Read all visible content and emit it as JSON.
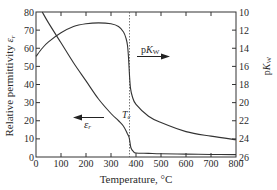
{
  "chart_data": {
    "type": "line",
    "title": "",
    "xlabel": "Temperature, °C",
    "ylabel": "Relative permittivity εr",
    "y2label": "pKw",
    "xlim": [
      0,
      800
    ],
    "ylim": [
      0,
      80
    ],
    "y2lim": [
      10,
      26
    ],
    "y2_inverted": true,
    "x_ticks": [
      0,
      100,
      200,
      300,
      400,
      500,
      600,
      700,
      800
    ],
    "y_ticks": [
      0,
      10,
      20,
      30,
      40,
      50,
      60,
      70,
      80
    ],
    "y2_ticks": [
      10,
      12,
      14,
      16,
      18,
      20,
      22,
      24,
      26
    ],
    "grid": false,
    "series": [
      {
        "name": "εr",
        "axis": "left",
        "x": [
          25,
          50,
          100,
          150,
          200,
          250,
          300,
          330,
          350,
          365,
          372,
          376,
          380,
          390,
          400,
          450,
          500,
          600,
          700,
          800
        ],
        "values": [
          80,
          74,
          63,
          52,
          42,
          32,
          24,
          20,
          17,
          13,
          11,
          8,
          5,
          3,
          2.2,
          2,
          1.8,
          1.6,
          1.4,
          1.3
        ]
      },
      {
        "name": "pKw",
        "axis": "right",
        "x": [
          0,
          25,
          50,
          100,
          150,
          200,
          250,
          300,
          330,
          350,
          360,
          366,
          370,
          374,
          378,
          385,
          400,
          450,
          500,
          600,
          700,
          800
        ],
        "values": [
          14.9,
          14.0,
          13.3,
          12.3,
          11.6,
          11.3,
          11.2,
          11.3,
          11.6,
          12.2,
          12.9,
          13.7,
          15.0,
          17.0,
          18.4,
          19.3,
          20.2,
          21.5,
          22.2,
          23.2,
          23.7,
          24.1
        ]
      }
    ],
    "annotations": [
      {
        "text": "Tc",
        "x": 374,
        "type": "vertical-dashed-line"
      },
      {
        "text": "pKw",
        "arrow": "right"
      },
      {
        "text": "εr",
        "arrow": "left"
      }
    ]
  },
  "labels": {
    "xlabel": "Temperature, °C",
    "ylabel_main": "Relative permittivity ",
    "ylabel_sym": "ε",
    "ylabel_sub": "r",
    "y2label_p": "p",
    "y2label_K": "K",
    "y2label_sub": "W",
    "tc_T": "T",
    "tc_sub": "c",
    "er_sym": "ε",
    "er_sub": "r",
    "pk_p": "p",
    "pk_K": "K",
    "pk_sub": "W"
  }
}
